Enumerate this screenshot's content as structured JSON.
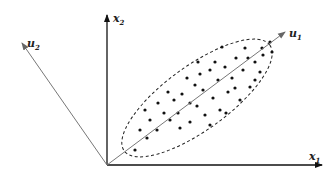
{
  "diagram": {
    "title": "",
    "type": "PCA principal axes over correlated 2D data",
    "labels": {
      "x1": {
        "base": "x",
        "sub": "1"
      },
      "x2": {
        "base": "x",
        "sub": "2"
      },
      "u1": {
        "base": "u",
        "sub": "1"
      },
      "u2": {
        "base": "u",
        "sub": "2"
      }
    },
    "colors": {
      "axis": "#111111",
      "principal_axis": "#777777",
      "ellipse": "#222222",
      "points": "#111111",
      "background": "#ffffff"
    },
    "geometry": {
      "origin": [
        107,
        165
      ],
      "x1_end": [
        322,
        165
      ],
      "x2_end": [
        107,
        15
      ],
      "u1_end": [
        285,
        32
      ],
      "u2_end": [
        22,
        43
      ],
      "ellipse": {
        "cx": 197,
        "cy": 98,
        "rx": 90,
        "ry": 32,
        "rotate": -36
      }
    },
    "points": [
      [
        135,
        150
      ],
      [
        140,
        130
      ],
      [
        147,
        138
      ],
      [
        150,
        120
      ],
      [
        157,
        130
      ],
      [
        164,
        113
      ],
      [
        170,
        120
      ],
      [
        174,
        100
      ],
      [
        178,
        113
      ],
      [
        182,
        94
      ],
      [
        190,
        103
      ],
      [
        190,
        122
      ],
      [
        195,
        85
      ],
      [
        197,
        106
      ],
      [
        203,
        90
      ],
      [
        205,
        115
      ],
      [
        210,
        70
      ],
      [
        213,
        98
      ],
      [
        218,
        80
      ],
      [
        220,
        110
      ],
      [
        225,
        67
      ],
      [
        228,
        92
      ],
      [
        232,
        78
      ],
      [
        236,
        58
      ],
      [
        240,
        100
      ],
      [
        243,
        70
      ],
      [
        248,
        58
      ],
      [
        250,
        87
      ],
      [
        255,
        62
      ],
      [
        260,
        72
      ],
      [
        262,
        48
      ],
      [
        263,
        55
      ],
      [
        158,
        103
      ],
      [
        180,
        128
      ],
      [
        200,
        74
      ],
      [
        215,
        62
      ],
      [
        235,
        88
      ],
      [
        255,
        80
      ],
      [
        168,
        92
      ],
      [
        145,
        110
      ],
      [
        187,
        78
      ],
      [
        222,
        47
      ],
      [
        245,
        48
      ],
      [
        272,
        52
      ],
      [
        270,
        42
      ],
      [
        198,
        62
      ],
      [
        210,
        125
      ],
      [
        226,
        113
      ]
    ]
  }
}
